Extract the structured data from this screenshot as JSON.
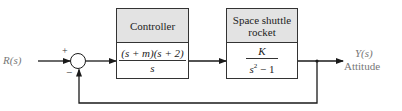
{
  "diagram": {
    "type": "feedback control block diagram",
    "input": {
      "label": "R(s)"
    },
    "summing_junction": {
      "plus_sign": "+",
      "minus_sign": "−"
    },
    "controller": {
      "title": "Controller",
      "numerator": "(s + m)(s + 2)",
      "denominator": "s"
    },
    "plant": {
      "title_line1": "Space shuttle",
      "title_line2": "rocket",
      "numerator": "K",
      "denominator_base": "s",
      "denominator_exp": "2",
      "denominator_rest": " − 1"
    },
    "output": {
      "label": "Y(s)",
      "sublabel": "Attitude"
    },
    "feedback": {
      "type": "unity negative feedback"
    },
    "colors": {
      "line": "#1a1a1a",
      "header_fill": "#e3e3e3",
      "label_gray": "#777777"
    }
  }
}
